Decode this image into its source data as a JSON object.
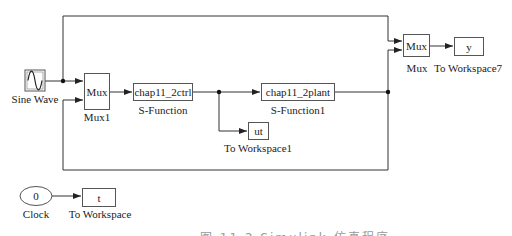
{
  "diagram": {
    "type": "simulink-block-diagram",
    "blocks": [
      {
        "id": "sine",
        "display": "",
        "name": "Sine Wave",
        "icon": "sine-wave-icon"
      },
      {
        "id": "mux1",
        "display": "Mux",
        "name": "Mux1"
      },
      {
        "id": "ctrl",
        "display": "chap11_2ctrl",
        "name": "S-Function"
      },
      {
        "id": "plant",
        "display": "chap11_2plant",
        "name": "S-Function1"
      },
      {
        "id": "ut",
        "display": "ut",
        "name": "To Workspace1"
      },
      {
        "id": "mux",
        "display": "Mux",
        "name": "Mux"
      },
      {
        "id": "y",
        "display": "y",
        "name": "To Workspace7"
      },
      {
        "id": "clock",
        "display": "0",
        "name": "Clock"
      },
      {
        "id": "t",
        "display": "t",
        "name": "To Workspace"
      }
    ],
    "connections": [
      {
        "from": "sine",
        "to": "mux1",
        "port": 1
      },
      {
        "from": "sine",
        "to": "mux",
        "port": 1
      },
      {
        "from": "mux1",
        "to": "ctrl"
      },
      {
        "from": "ctrl",
        "to": "plant"
      },
      {
        "from": "ctrl",
        "to": "ut"
      },
      {
        "from": "plant",
        "to": "mux",
        "port": 2
      },
      {
        "from": "plant",
        "to": "mux1",
        "port": 2
      },
      {
        "from": "clock",
        "to": "t"
      }
    ],
    "caption": "图 11.2  Simulink 仿真程序"
  }
}
